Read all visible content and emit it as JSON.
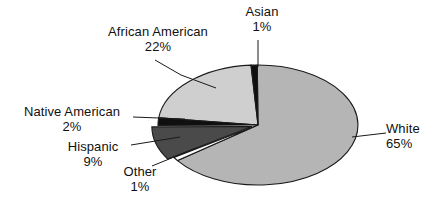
{
  "chart_data": {
    "type": "pie",
    "title": "",
    "categories": [
      "African American",
      "Asian",
      "White",
      "Other",
      "Hispanic",
      "Native American"
    ],
    "values": [
      22,
      1,
      65,
      1,
      9,
      2
    ],
    "value_suffix": "%",
    "legend": "none",
    "labels_position": "outside-with-leader-lines",
    "exploded_slices": [
      "Hispanic"
    ],
    "slices": [
      {
        "name": "Asian",
        "label": "Asian",
        "percent": 1,
        "percent_text": "1%",
        "color": "#0f0f0f",
        "start_angle_deg": 356,
        "end_angle_deg": 359.6
      },
      {
        "name": "White",
        "label": "White",
        "percent": 65,
        "percent_text": "65%",
        "color": "#b5b5b5",
        "start_angle_deg": 359.6,
        "end_angle_deg": 593.6
      },
      {
        "name": "Other",
        "label": "Other",
        "percent": 1,
        "percent_text": "1%",
        "color": "#ffffff",
        "start_angle_deg": 593.6,
        "end_angle_deg": 597.2
      },
      {
        "name": "Hispanic",
        "label": "Hispanic",
        "percent": 9,
        "percent_text": "9%",
        "color": "#4a4a4a",
        "start_angle_deg": 597.2,
        "end_angle_deg": 629.6
      },
      {
        "name": "Native American",
        "label": "Native American",
        "percent": 2,
        "percent_text": "2%",
        "color": "#0f0f0f",
        "start_angle_deg": 629.6,
        "end_angle_deg": 636.8
      },
      {
        "name": "African American",
        "label": "African American",
        "percent": 22,
        "percent_text": "22%",
        "color": "#cfcfcf",
        "start_angle_deg": 636.8,
        "end_angle_deg": 716
      }
    ],
    "colors": {
      "white_slice": "#b5b5b5",
      "african_american_slice": "#cfcfcf",
      "hispanic_slice": "#4a4a4a",
      "asian_slice": "#0f0f0f",
      "native_american_slice": "#0f0f0f",
      "other_slice": "#ffffff",
      "outline": "#1a1a1a",
      "leader_line": "#1a1a1a",
      "text": "#111111",
      "background": "#ffffff"
    }
  },
  "labels": {
    "african_american": {
      "name": "African American",
      "percent": "22%"
    },
    "asian": {
      "name": "Asian",
      "percent": "1%"
    },
    "native_american": {
      "name": "Native American",
      "percent": "2%"
    },
    "hispanic": {
      "name": "Hispanic",
      "percent": "9%"
    },
    "other": {
      "name": "Other",
      "percent": "1%"
    },
    "white": {
      "name": "White",
      "percent": "65%"
    }
  }
}
